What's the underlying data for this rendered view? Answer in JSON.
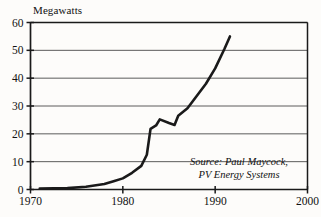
{
  "chart_data": {
    "type": "line",
    "title": "",
    "ylabel": "Megawatts",
    "xlabel": "",
    "xlim": [
      1970,
      2000
    ],
    "ylim": [
      0,
      60
    ],
    "grid": true,
    "legend": null,
    "xticks": [
      "1970",
      "1980",
      "1990",
      "2000"
    ],
    "xtick_values": [
      1970,
      1980,
      1990,
      2000
    ],
    "yticks": [
      "0",
      "10",
      "20",
      "30",
      "40",
      "50",
      "60"
    ],
    "ytick_values": [
      0,
      10,
      20,
      30,
      40,
      50,
      60
    ],
    "series": [
      {
        "name": "World photovoltaic shipments",
        "x": [
          1971,
          1974,
          1976,
          1978,
          1979,
          1980,
          1981,
          1982,
          1982.6,
          1983,
          1983.6,
          1984,
          1985,
          1985.6,
          1986,
          1987,
          1988,
          1989,
          1990,
          1991,
          1991.6
        ],
        "values": [
          0.3,
          0.5,
          1.0,
          2.0,
          3.0,
          4.0,
          6.0,
          8.5,
          12.5,
          21.8,
          23.0,
          25.2,
          23.9,
          23.2,
          26.5,
          29.2,
          33.6,
          38.0,
          43.5,
          50.5,
          55.0
        ]
      }
    ],
    "annotations": [
      {
        "name": "source-note",
        "text": "Source: Paul Maycock,\nPV Energy Systems"
      }
    ],
    "colors": {
      "line": "#1a1a1a",
      "grid": "#4a4a4a",
      "frame": "#1a1a1a",
      "background": "#fdfcfa",
      "text": "#111111"
    }
  }
}
